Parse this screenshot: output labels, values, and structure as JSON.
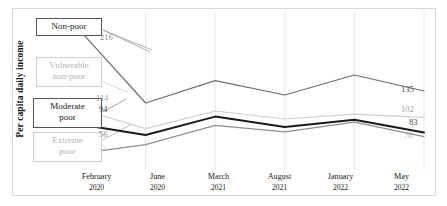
{
  "chart_data": {
    "type": "line",
    "title": "",
    "xlabel": "",
    "ylabel": "Per capita daily income",
    "categories": [
      "February 2020",
      "June 2020",
      "March 2021",
      "August 2021",
      "January 2022",
      "May 2022"
    ],
    "x_ticks": [
      {
        "month": "February",
        "year": "2020"
      },
      {
        "month": "June",
        "year": "2020"
      },
      {
        "month": "March",
        "year": "2021"
      },
      {
        "month": "August",
        "year": "2021"
      },
      {
        "month": "January",
        "year": "2022"
      },
      {
        "month": "May",
        "year": "2022"
      }
    ],
    "ylim": [
      40,
      230
    ],
    "grid": "vertical",
    "legend": "inline-callout-boxes",
    "series": [
      {
        "name": "Non-poor",
        "color": "#6e6e6e",
        "width": 1.2,
        "values": [
          216,
          120,
          148,
          130,
          155,
          135
        ],
        "start_label": "216",
        "end_label": "135"
      },
      {
        "name": "Vulnerable non-poor",
        "color": "#cfcfcf",
        "width": 1.2,
        "values": [
          114,
          88,
          110,
          100,
          106,
          102
        ],
        "start_label": "114",
        "end_label": "102"
      },
      {
        "name": "Moderate poor",
        "color": "#1a1a1a",
        "width": 2.0,
        "values": [
          94,
          80,
          103,
          90,
          99,
          83
        ],
        "start_label": "94",
        "end_label": "83"
      },
      {
        "name": "Extreme poor",
        "color": "#8f8f8f",
        "width": 1.2,
        "values": [
          56,
          68,
          92,
          84,
          96,
          78
        ],
        "start_label": "56",
        "end_label": "78"
      }
    ]
  },
  "callouts": [
    {
      "label": "Non-poor",
      "style": "strong"
    },
    {
      "label": "Vulnerable\nnon-poor",
      "style": "faint"
    },
    {
      "label": "Moderate\npoor",
      "style": "strong"
    },
    {
      "label": "Extreme\npoor",
      "style": "faint"
    }
  ],
  "callout_labels": {
    "non_poor": "Non-poor",
    "vulnerable_non_poor_l1": "Vulnerable",
    "vulnerable_non_poor_l2": "non-poor",
    "moderate_poor_l1": "Moderate",
    "moderate_poor_l2": "poor",
    "extreme_poor_l1": "Extreme",
    "extreme_poor_l2": "poor"
  },
  "start_values": {
    "non_poor": "216",
    "vulnerable_non_poor": "114",
    "moderate_poor": "94",
    "extreme_poor": "56"
  },
  "end_values": {
    "non_poor": "135",
    "vulnerable_non_poor": "102",
    "moderate_poor": "83",
    "extreme_poor": "78"
  }
}
